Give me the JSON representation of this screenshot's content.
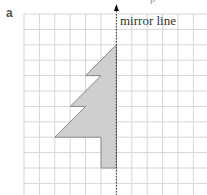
{
  "question": {
    "label": "a",
    "header_fragment": "p"
  },
  "diagram": {
    "type": "reflection-grid",
    "mirror_label": "mirror line",
    "grid": {
      "origin_x": 24,
      "origin_y": 14,
      "cell": 15.4,
      "cols": 12,
      "rows": 12,
      "line_color": "#d6d6d6"
    },
    "mirror_column": 6,
    "shape": {
      "name": "half-tree",
      "fill": "#cfcfcf",
      "stroke": "#8a8a8a",
      "vertices_grid": [
        [
          6,
          2
        ],
        [
          4,
          4
        ],
        [
          5,
          4
        ],
        [
          3,
          6
        ],
        [
          4,
          6
        ],
        [
          2,
          8
        ],
        [
          5,
          8
        ],
        [
          5,
          10
        ],
        [
          6,
          10
        ]
      ]
    },
    "colors": {
      "mirror_line": "#333333",
      "arrow": "#111111"
    }
  }
}
